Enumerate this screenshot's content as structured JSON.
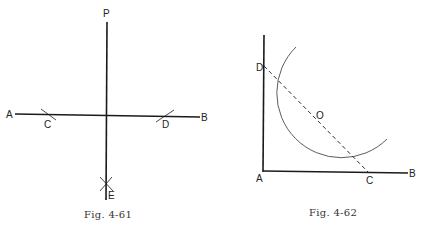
{
  "figures": [
    {
      "caption": "Fig. 4-61",
      "labels": {
        "P": "P",
        "A": "A",
        "B": "B",
        "C": "C",
        "D": "D",
        "E": "E"
      }
    },
    {
      "caption": "Fig. 4-62",
      "labels": {
        "A": "A",
        "B": "B",
        "C": "C",
        "D": "D",
        "O": "O"
      }
    }
  ],
  "colors": {
    "ink": "#1a1a1a",
    "paper": "#ffffff"
  }
}
